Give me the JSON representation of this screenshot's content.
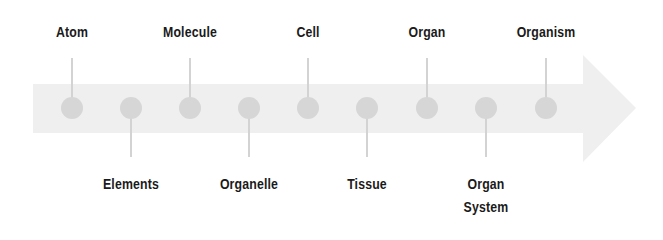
{
  "diagram": {
    "type": "timeline-arrow",
    "colors": {
      "arrow": "#efefef",
      "dot": "#d6d6d6",
      "stem": "#d3d3d3",
      "text": "#1a1a1a"
    },
    "nodes": [
      {
        "label": "Atom",
        "x": 72,
        "side": "top"
      },
      {
        "label": "Elements",
        "x": 131,
        "side": "bottom"
      },
      {
        "label": "Molecule",
        "x": 190,
        "side": "top"
      },
      {
        "label": "Organelle",
        "x": 249,
        "side": "bottom"
      },
      {
        "label": "Cell",
        "x": 308,
        "side": "top"
      },
      {
        "label": "Tissue",
        "x": 367,
        "side": "bottom"
      },
      {
        "label": "Organ",
        "x": 427,
        "side": "top"
      },
      {
        "label": "Organ System",
        "x": 486,
        "side": "bottom",
        "lines": [
          "Organ",
          "System"
        ]
      },
      {
        "label": "Organism",
        "x": 546,
        "side": "top"
      }
    ]
  }
}
